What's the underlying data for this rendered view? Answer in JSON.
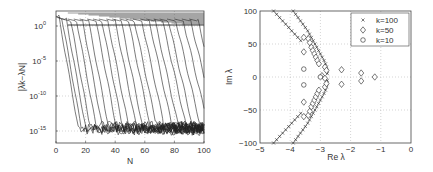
{
  "chart_data": [
    {
      "type": "line",
      "title": "",
      "xlabel": "N",
      "ylabel": "|λk−λN|",
      "yscale": "log",
      "xlim": [
        0,
        100
      ],
      "ylim_exponent": [
        -17,
        1.5
      ],
      "grid": true,
      "x_ticks": [
        "0",
        "20",
        "40",
        "60",
        "80",
        "100"
      ],
      "y_ticks": [
        "10^0",
        "10^-5",
        "10^-10",
        "10^-15"
      ],
      "description": "Family of convergence curves of eigenvalue errors vs N; each curve starts near 10^0 and drops steeply to a noise floor around 10^-14..10^-15, with successive curves shifted right by roughly 5 in N.",
      "series_onsets_N": [
        2,
        4,
        7,
        10,
        14,
        18,
        22,
        27,
        31,
        35,
        40,
        44,
        49,
        53,
        58,
        63,
        67,
        72,
        76,
        81,
        86,
        91,
        96
      ],
      "noise_floor_exponent": [
        -15,
        -13.5
      ]
    },
    {
      "type": "scatter",
      "title": "",
      "xlabel": "Re λ",
      "ylabel": "Im λ",
      "xlim": [
        -5,
        0
      ],
      "ylim": [
        -100,
        100
      ],
      "grid": true,
      "x_ticks": [
        "-5",
        "-4",
        "-3",
        "-2",
        "-1",
        "0"
      ],
      "y_ticks": [
        "-100",
        "-50",
        "0",
        "50",
        "100"
      ],
      "legend_position": "upper right",
      "series": [
        {
          "name": "k=100",
          "marker": "x",
          "points": [
            [
              -4.55,
              100
            ],
            [
              -4.45,
              95
            ],
            [
              -4.35,
              90
            ],
            [
              -4.25,
              85
            ],
            [
              -4.15,
              80
            ],
            [
              -4.05,
              75
            ],
            [
              -3.95,
              70
            ],
            [
              -3.85,
              65
            ],
            [
              -3.75,
              60
            ],
            [
              -3.65,
              55
            ],
            [
              -3.9,
              100
            ],
            [
              -3.82,
              95
            ],
            [
              -3.74,
              90
            ],
            [
              -3.66,
              85
            ],
            [
              -3.58,
              80
            ],
            [
              -3.5,
              75
            ],
            [
              -3.42,
              70
            ],
            [
              -3.36,
              65
            ],
            [
              -3.3,
              60
            ],
            [
              -3.24,
              55
            ],
            [
              -3.18,
              50
            ],
            [
              -3.12,
              45
            ],
            [
              -3.06,
              40
            ],
            [
              -3.0,
              35
            ],
            [
              -2.94,
              30
            ],
            [
              -2.88,
              25
            ],
            [
              -2.83,
              20
            ],
            [
              -2.8,
              15
            ],
            [
              -2.78,
              10
            ],
            [
              -2.77,
              5
            ],
            [
              -4.55,
              -100
            ],
            [
              -4.45,
              -95
            ],
            [
              -4.35,
              -90
            ],
            [
              -4.25,
              -85
            ],
            [
              -4.15,
              -80
            ],
            [
              -4.05,
              -75
            ],
            [
              -3.95,
              -70
            ],
            [
              -3.85,
              -65
            ],
            [
              -3.75,
              -60
            ],
            [
              -3.65,
              -55
            ],
            [
              -3.9,
              -100
            ],
            [
              -3.82,
              -95
            ],
            [
              -3.74,
              -90
            ],
            [
              -3.66,
              -85
            ],
            [
              -3.58,
              -80
            ],
            [
              -3.5,
              -75
            ],
            [
              -3.42,
              -70
            ],
            [
              -3.36,
              -65
            ],
            [
              -3.3,
              -60
            ],
            [
              -3.24,
              -55
            ],
            [
              -3.18,
              -50
            ],
            [
              -3.12,
              -45
            ],
            [
              -3.06,
              -40
            ],
            [
              -3.0,
              -35
            ],
            [
              -2.94,
              -30
            ],
            [
              -2.88,
              -25
            ],
            [
              -2.83,
              -20
            ],
            [
              -2.8,
              -15
            ],
            [
              -2.78,
              -10
            ],
            [
              -2.77,
              -5
            ]
          ]
        },
        {
          "name": "k=50",
          "marker": "diamond",
          "points": [
            [
              -3.55,
              60
            ],
            [
              -3.55,
              38
            ],
            [
              -3.4,
              58
            ],
            [
              -3.35,
              52
            ],
            [
              -3.3,
              45
            ],
            [
              -3.25,
              40
            ],
            [
              -3.2,
              35
            ],
            [
              -3.15,
              30
            ],
            [
              -3.1,
              25
            ],
            [
              -3.05,
              20
            ],
            [
              -2.85,
              15
            ],
            [
              -2.8,
              10
            ],
            [
              -2.95,
              2
            ],
            [
              -2.85,
              -2
            ],
            [
              -3.55,
              -60
            ],
            [
              -3.55,
              -38
            ],
            [
              -3.4,
              -58
            ],
            [
              -3.35,
              -52
            ],
            [
              -3.3,
              -45
            ],
            [
              -3.25,
              -40
            ],
            [
              -3.2,
              -35
            ],
            [
              -3.15,
              -30
            ],
            [
              -3.1,
              -25
            ],
            [
              -3.05,
              -20
            ],
            [
              -2.85,
              -15
            ],
            [
              -2.8,
              -10
            ],
            [
              -2.3,
              11
            ],
            [
              -2.3,
              -11
            ],
            [
              -1.65,
              6
            ],
            [
              -1.65,
              -6
            ],
            [
              -1.2,
              0
            ]
          ]
        },
        {
          "name": "k=10",
          "marker": "circle",
          "points": [
            [
              -3.55,
              12
            ],
            [
              -3.55,
              -12
            ],
            [
              -3.0,
              0
            ]
          ]
        }
      ]
    }
  ]
}
